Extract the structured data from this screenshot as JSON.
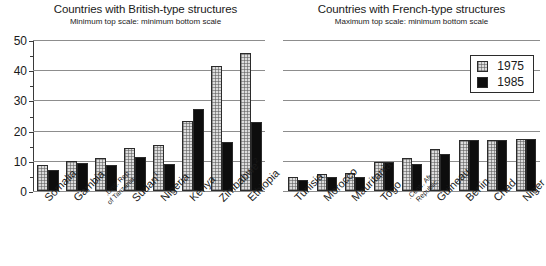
{
  "chart_data": [
    {
      "type": "bar",
      "panel": "left",
      "title": "Countries with British-type structures",
      "subtitle": "Minimum top scale: minimum bottom scale",
      "xlabel": "",
      "ylabel": "",
      "ylim": [
        0,
        50
      ],
      "yticks": [
        0,
        10,
        20,
        30,
        40,
        50
      ],
      "ytick_labels": [
        "0",
        "10",
        "20",
        "30",
        "40",
        "50"
      ],
      "grid": true,
      "legend": [
        "1975",
        "1985"
      ],
      "legend_position": "none",
      "categories": [
        "Somalia",
        "Gambia",
        "Unit. Rep. of Tanzania",
        "Sudan",
        "Nigeria",
        "Kenya",
        "Zimbabwe",
        "Ethiopia"
      ],
      "category_footnotes": [
        "",
        "",
        "",
        "1",
        "",
        "",
        "2",
        ""
      ],
      "series": [
        {
          "name": "1975",
          "values": [
            8.5,
            10.0,
            10.8,
            14.2,
            15.4,
            23.2,
            41.4,
            45.6
          ]
        },
        {
          "name": "1985",
          "values": [
            6.8,
            9.2,
            8.6,
            11.4,
            8.9,
            27.0,
            16.1,
            22.7
          ]
        }
      ]
    },
    {
      "type": "bar",
      "panel": "right",
      "title": "Countries with French-type structures",
      "subtitle": "Maximum top scale: minimum bottom scale",
      "xlabel": "",
      "ylabel": "",
      "ylim": [
        0,
        50
      ],
      "yticks": [
        0,
        10,
        20,
        30,
        40,
        50
      ],
      "ytick_labels": [
        "",
        "",
        "",
        "",
        "",
        ""
      ],
      "grid": true,
      "legend": [
        "1975",
        "1985"
      ],
      "legend_position": "upper right",
      "categories": [
        "Tunisia",
        "Morocco",
        "Mauritania",
        "Togo",
        "Centr. Afr. Republic",
        "Guineau",
        "Benin",
        "Chad",
        "Niger"
      ],
      "category_footnotes": [
        "",
        "",
        "",
        "",
        "",
        "",
        "",
        "",
        ""
      ],
      "series": [
        {
          "name": "1975",
          "values": [
            4.6,
            5.6,
            6.1,
            9.5,
            11.0,
            14.0,
            17.0,
            17.0,
            17.3
          ]
        },
        {
          "name": "1985",
          "values": [
            3.6,
            4.5,
            4.6,
            9.5,
            9.0,
            12.2,
            17.0,
            17.0,
            17.3
          ]
        }
      ]
    }
  ],
  "left_panel": {
    "title": "Countries with British-type structures",
    "subtitle": "Minimum top scale: minimum bottom scale",
    "ytick_labels": [
      "50",
      "40",
      "30",
      "20",
      "10",
      "0"
    ],
    "categories": [
      {
        "label": "Somalia",
        "footnote": "",
        "small": false
      },
      {
        "label": "Gambia",
        "footnote": "",
        "small": false
      },
      {
        "label": "Unit. Rep. of Tanzania",
        "footnote": "",
        "small": true
      },
      {
        "label": "Sudan",
        "footnote": "1",
        "small": false
      },
      {
        "label": "Nigeria",
        "footnote": "",
        "small": false
      },
      {
        "label": "Kenya",
        "footnote": "",
        "small": false
      },
      {
        "label": "Zimbabwe",
        "footnote": "2",
        "small": false
      },
      {
        "label": "Ethiopia",
        "footnote": "",
        "small": false
      }
    ]
  },
  "right_panel": {
    "title": "Countries with French-type structures",
    "subtitle": "Maximum top scale: minimum bottom scale",
    "categories": [
      {
        "label": "Tunisia",
        "footnote": "",
        "small": false
      },
      {
        "label": "Morocco",
        "footnote": "",
        "small": false
      },
      {
        "label": "Mauritania",
        "footnote": "",
        "small": false
      },
      {
        "label": "Togo",
        "footnote": "",
        "small": false
      },
      {
        "label": "Centr. Afr. Republic",
        "footnote": "",
        "small": true
      },
      {
        "label": "Guineau",
        "footnote": "",
        "small": false
      },
      {
        "label": "Benin",
        "footnote": "",
        "small": false
      },
      {
        "label": "Chad",
        "footnote": "",
        "small": false
      },
      {
        "label": "Niger",
        "footnote": "",
        "small": false
      }
    ]
  },
  "legend": {
    "items": [
      {
        "label": "1975",
        "style": "dotted"
      },
      {
        "label": "1985",
        "style": "solid-black"
      }
    ]
  },
  "colors": {
    "series_1975": "#dcdcdc",
    "series_1985": "#0d0d0d",
    "gridline": "#8d8d8d",
    "axis": "#3a3a3a",
    "text": "#1a1a1a",
    "background": "#ffffff"
  }
}
